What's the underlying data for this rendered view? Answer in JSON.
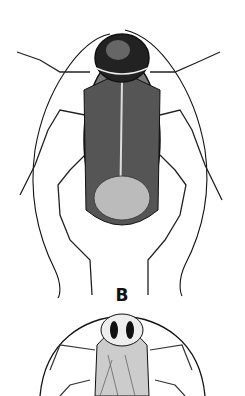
{
  "figure": {
    "panel_label": "B",
    "subjects": [
      {
        "name": "cockroach-top",
        "view": "dorsal",
        "position": "upper"
      },
      {
        "name": "cockroach-bottom",
        "view": "dorsal",
        "position": "lower, partially cropped"
      }
    ],
    "colors": {
      "ink": "#111111",
      "background": "#ffffff",
      "shade": "#555555"
    }
  }
}
